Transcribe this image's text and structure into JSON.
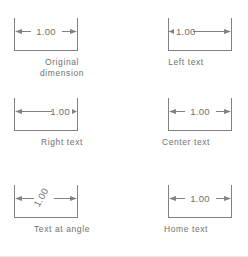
{
  "figure": {
    "dimension_value": "1.00",
    "line_color": "#808285",
    "text_color": "#6f7173",
    "background_color": "#ffffff",
    "border_color": "#e9eaec"
  },
  "cells": [
    {
      "id": "original-dimension",
      "caption": "Original\ndimension",
      "value": "1.00",
      "text_placement": "centered",
      "text_angle": 0,
      "arrow_style": "inside-both"
    },
    {
      "id": "left-text",
      "caption": "Left text",
      "value": "1.00",
      "text_placement": "left",
      "text_angle": 0,
      "arrow_style": "inside-both"
    },
    {
      "id": "right-text",
      "caption": "Right text",
      "value": "1.00",
      "text_placement": "right",
      "text_angle": 0,
      "arrow_style": "inside-both"
    },
    {
      "id": "center-text",
      "caption": "Center text",
      "value": "1.00",
      "text_placement": "centered",
      "text_angle": 0,
      "arrow_style": "inside-both"
    },
    {
      "id": "text-at-angle",
      "caption": "Text at angle",
      "value": "1.00",
      "text_placement": "centered",
      "text_angle": 60,
      "arrow_style": "inside-both"
    },
    {
      "id": "home-text",
      "caption": "Home text",
      "value": "1.00",
      "text_placement": "centered",
      "text_angle": 0,
      "arrow_style": "inside-both"
    }
  ]
}
